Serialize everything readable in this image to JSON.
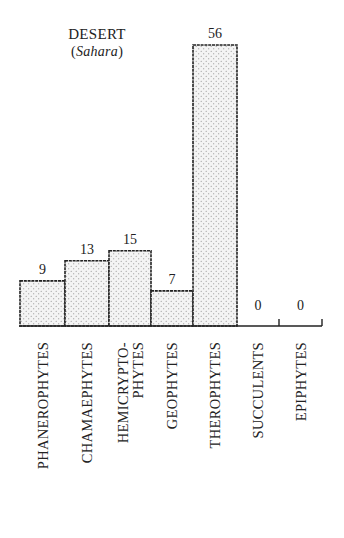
{
  "chart_data": {
    "type": "bar",
    "title": "DESERT",
    "subtitle": "Sahara",
    "categories": [
      "PHANEROPHYTES",
      "CHAMAEPHYTES",
      "HEMICRYPTO-PHYTES",
      "GEOPHYTES",
      "THEROPHYTES",
      "SUCCULENTS",
      "EPIPHYTES"
    ],
    "category_label_lines": [
      [
        "PHANEROPHYTES"
      ],
      [
        "CHAMAEPHYTES"
      ],
      [
        "HEMICRYPTO-",
        "PHYTES"
      ],
      [
        "GEOPHYTES"
      ],
      [
        "THEROPHYTES"
      ],
      [
        "SUCCULENTS"
      ],
      [
        "EPIPHYTES"
      ]
    ],
    "values": [
      9,
      13,
      15,
      7,
      56,
      0,
      0
    ],
    "value_labels": [
      "9",
      "13",
      "15",
      "7",
      "56",
      "0",
      "0"
    ],
    "xlabel": "",
    "ylabel": "",
    "ylim": [
      0,
      56
    ],
    "grid": false,
    "legend": null,
    "bar_fill": "stippled",
    "colors": {
      "bar_fill": "#f4f4f4",
      "bar_stroke": "#222222",
      "dots": "#888888"
    }
  },
  "title": {
    "main": "DESERT",
    "paren_open": "(",
    "sub": "Sahara",
    "paren_close": ")"
  }
}
